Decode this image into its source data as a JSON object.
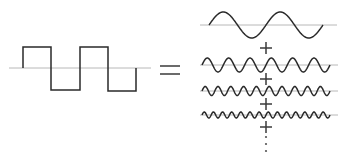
{
  "diagram": {
    "left": {
      "label": "square-wave",
      "periods": 2
    },
    "operator": "=",
    "right": {
      "components": [
        {
          "harmonic": 1,
          "periods": 2,
          "amplitude": 13
        },
        {
          "harmonic": 3,
          "periods": 6,
          "amplitude": 7
        },
        {
          "harmonic": 5,
          "periods": 10,
          "amplitude": 4.5
        },
        {
          "harmonic": 7,
          "periods": 14,
          "amplitude": 3
        }
      ],
      "joiner": "+",
      "continuation": "⋮"
    },
    "colors": {
      "stroke": "#2a2a2a",
      "axis": "#b8b8b8",
      "background": "#ffffff"
    }
  }
}
